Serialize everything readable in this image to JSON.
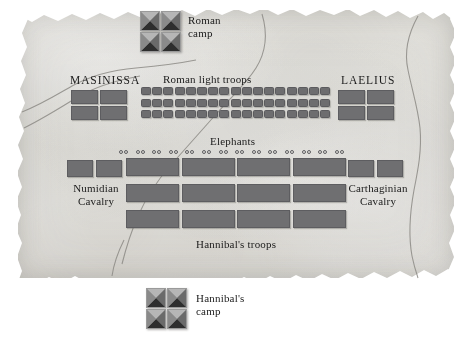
{
  "map": {
    "title": "Battle of Zama troop deployment map",
    "background_style": "aged parchment with torn edges",
    "colors": {
      "parchment": "#e3e2de",
      "unit_fill": "#6f6f71",
      "unit_stroke": "#5d5d60",
      "tent_fill": "#9d9d9d",
      "tent_shadow": "#2b2b2b",
      "terrain_line": "#8d8b86",
      "text": "#1b1b1b"
    }
  },
  "labels": {
    "roman_camp": "Roman\ncamp",
    "roman_light_troops": "Roman light troops",
    "masinissa": "MASINISSA",
    "laelius": "LAELIUS",
    "elephants": "Elephants",
    "numidian_cavalry": "Numidian\nCavalry",
    "carthaginian_cavalry": "Carthaginian\nCavalry",
    "hannibals_troops": "Hannibal's troops",
    "hannibals_camp": "Hannibal's\ncamp"
  },
  "formations": {
    "roman_camp": {
      "name": "Roman camp",
      "icon": "tent-icon",
      "rows": 2,
      "cols": 2,
      "count": 4
    },
    "hannibals_camp": {
      "name": "Hannibal's camp",
      "icon": "tent-icon",
      "rows": 2,
      "cols": 2,
      "count": 4
    },
    "masinissa": {
      "name": "Masinissa cavalry",
      "rows": 2,
      "cols": 2,
      "count": 4
    },
    "laelius": {
      "name": "Laelius cavalry",
      "rows": 2,
      "cols": 2,
      "count": 4
    },
    "roman_light_troops": {
      "name": "Roman light troops",
      "rows": 3,
      "cols": 17,
      "count": 51
    },
    "elephants": {
      "name": "Elephants",
      "icon": "elephant-marker",
      "count": 14
    },
    "numidian_cavalry": {
      "name": "Numidian cavalry",
      "count": 2
    },
    "carthaginian_cavalry": {
      "name": "Carthaginian cavalry",
      "count": 2
    },
    "hannibals_troops": {
      "name": "Hannibal's troops",
      "rows": 3,
      "cols": 4,
      "count": 12
    }
  },
  "terrain": {
    "roads": [
      {
        "name": "northwest-road"
      },
      {
        "name": "central-diagonal-road"
      },
      {
        "name": "eastern-river"
      },
      {
        "name": "southern-road"
      }
    ]
  }
}
